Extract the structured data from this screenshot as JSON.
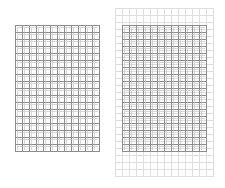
{
  "figure": {
    "left_grid": {
      "label": "",
      "columns": 12,
      "rows": 18,
      "x": 15,
      "y": 25,
      "cell_w": 7,
      "cell_h": 7,
      "line_color": "#8c8c8c"
    },
    "right_grid": {
      "label": "",
      "outer": {
        "columns": 14,
        "rows": 24,
        "x": 115,
        "y": 8,
        "cell_w": 7,
        "cell_h": 7,
        "line_color": "#dedede"
      },
      "inner": {
        "columns": 12,
        "rows": 18,
        "x": 122,
        "y": 25,
        "cell_w": 7,
        "cell_h": 7,
        "line_color": "#8c8c8c"
      }
    }
  }
}
